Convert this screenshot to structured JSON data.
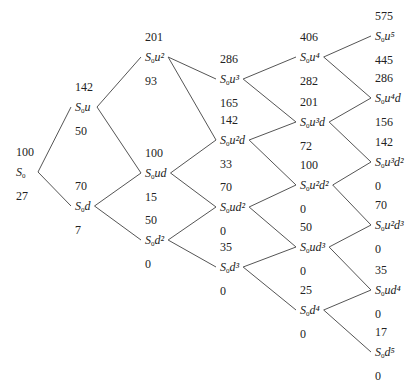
{
  "diagram": {
    "type": "binomial-tree",
    "steps": 5,
    "nodes": [
      {
        "id": "n00",
        "col": 0,
        "x": 16,
        "y": 172,
        "price": "100",
        "base": "S",
        "sub": "0",
        "expr": "",
        "option": "27"
      },
      {
        "id": "n10",
        "col": 1,
        "x": 75,
        "y": 107,
        "price": "142",
        "base": "S",
        "sub": "0",
        "expr": "u",
        "option": "50"
      },
      {
        "id": "n11",
        "col": 1,
        "x": 75,
        "y": 206,
        "price": "70",
        "base": "S",
        "sub": "0",
        "expr": "d",
        "option": "7"
      },
      {
        "id": "n20",
        "col": 2,
        "x": 145,
        "y": 57,
        "price": "201",
        "base": "S",
        "sub": "0",
        "expr": "u²",
        "option": "93"
      },
      {
        "id": "n21",
        "col": 2,
        "x": 145,
        "y": 173,
        "price": "100",
        "base": "S",
        "sub": "0",
        "expr": "ud",
        "option": "15"
      },
      {
        "id": "n22",
        "col": 2,
        "x": 145,
        "y": 240,
        "price": "50",
        "base": "S",
        "sub": "0",
        "expr": "d²",
        "option": "0"
      },
      {
        "id": "n30",
        "col": 3,
        "x": 220,
        "y": 79,
        "price": "286",
        "base": "S",
        "sub": "0",
        "expr": "u³",
        "option": "165"
      },
      {
        "id": "n31",
        "col": 3,
        "x": 220,
        "y": 140,
        "price": "142",
        "base": "S",
        "sub": "0",
        "expr": "u²d",
        "option": "33"
      },
      {
        "id": "n32",
        "col": 3,
        "x": 220,
        "y": 207,
        "price": "70",
        "base": "S",
        "sub": "0",
        "expr": "ud²",
        "option": "0"
      },
      {
        "id": "n33",
        "col": 3,
        "x": 220,
        "y": 267,
        "price": "35",
        "base": "S",
        "sub": "0",
        "expr": "d³",
        "option": "0"
      },
      {
        "id": "n40",
        "col": 4,
        "x": 300,
        "y": 57,
        "price": "406",
        "base": "S",
        "sub": "0",
        "expr": "u⁴",
        "option": "282"
      },
      {
        "id": "n41",
        "col": 4,
        "x": 300,
        "y": 122,
        "price": "201",
        "base": "S",
        "sub": "0",
        "expr": "u³d",
        "option": "72"
      },
      {
        "id": "n42",
        "col": 4,
        "x": 300,
        "y": 185,
        "price": "100",
        "base": "S",
        "sub": "0",
        "expr": "u²d²",
        "option": "0"
      },
      {
        "id": "n43",
        "col": 4,
        "x": 300,
        "y": 247,
        "price": "50",
        "base": "S",
        "sub": "0",
        "expr": "ud³",
        "option": "0"
      },
      {
        "id": "n44",
        "col": 4,
        "x": 300,
        "y": 310,
        "price": "25",
        "base": "S",
        "sub": "0",
        "expr": "d⁴",
        "option": "0"
      },
      {
        "id": "n50",
        "col": 5,
        "x": 375,
        "y": 36,
        "price": "575",
        "base": "S",
        "sub": "0",
        "expr": "u⁵",
        "option": "445"
      },
      {
        "id": "n51",
        "col": 5,
        "x": 375,
        "y": 98,
        "price": "286",
        "base": "S",
        "sub": "0",
        "expr": "u⁴d",
        "option": "156"
      },
      {
        "id": "n52",
        "col": 5,
        "x": 375,
        "y": 162,
        "price": "142",
        "base": "S",
        "sub": "0",
        "expr": "u³d²",
        "option": "0"
      },
      {
        "id": "n53",
        "col": 5,
        "x": 375,
        "y": 225,
        "price": "70",
        "base": "S",
        "sub": "0",
        "expr": "u²d³",
        "option": "0"
      },
      {
        "id": "n54",
        "col": 5,
        "x": 375,
        "y": 290,
        "price": "35",
        "base": "S",
        "sub": "0",
        "expr": "ud⁴",
        "option": "0"
      },
      {
        "id": "n55",
        "col": 5,
        "x": 375,
        "y": 352,
        "price": "17",
        "base": "S",
        "sub": "0",
        "expr": "d⁵",
        "option": "0"
      }
    ],
    "edges": [
      [
        "n00",
        "n10"
      ],
      [
        "n00",
        "n11"
      ],
      [
        "n10",
        "n20"
      ],
      [
        "n10",
        "n21"
      ],
      [
        "n11",
        "n21"
      ],
      [
        "n11",
        "n22"
      ],
      [
        "n20",
        "n30"
      ],
      [
        "n20",
        "n31"
      ],
      [
        "n21",
        "n31"
      ],
      [
        "n21",
        "n32"
      ],
      [
        "n22",
        "n32"
      ],
      [
        "n22",
        "n33"
      ],
      [
        "n30",
        "n40"
      ],
      [
        "n30",
        "n41"
      ],
      [
        "n31",
        "n41"
      ],
      [
        "n31",
        "n42"
      ],
      [
        "n32",
        "n42"
      ],
      [
        "n32",
        "n43"
      ],
      [
        "n33",
        "n43"
      ],
      [
        "n33",
        "n44"
      ],
      [
        "n40",
        "n50"
      ],
      [
        "n40",
        "n51"
      ],
      [
        "n41",
        "n51"
      ],
      [
        "n41",
        "n52"
      ],
      [
        "n42",
        "n52"
      ],
      [
        "n42",
        "n53"
      ],
      [
        "n43",
        "n53"
      ],
      [
        "n43",
        "n54"
      ],
      [
        "n44",
        "n54"
      ],
      [
        "n44",
        "n55"
      ]
    ]
  }
}
